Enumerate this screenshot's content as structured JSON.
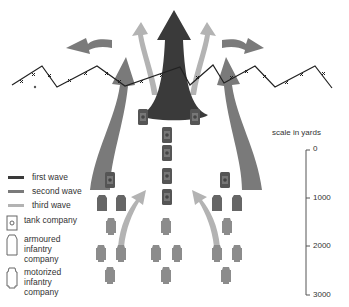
{
  "colors": {
    "first_wave": "#3a3a3a",
    "second_wave": "#7a7a7a",
    "third_wave": "#b3b3b3",
    "unit_dark": "#555555",
    "unit_light": "#8c8c8c",
    "wire": "#222222"
  },
  "legend": {
    "items": [
      {
        "label": "first wave",
        "color": "#3a3a3a"
      },
      {
        "label": "second wave",
        "color": "#7a7a7a"
      },
      {
        "label": "third wave",
        "color": "#b3b3b3"
      }
    ],
    "units": [
      {
        "icon": "tank-company-icon",
        "label": "tank company"
      },
      {
        "icon": "armoured-infantry-company-icon",
        "label_lines": [
          "armoured",
          "infantry",
          "company"
        ]
      },
      {
        "icon": "motorized-infantry-company-icon",
        "label_lines": [
          "motorized",
          "infantry",
          "company"
        ]
      }
    ]
  },
  "scale": {
    "title": "scale in yards",
    "ticks": [
      "0",
      "1000",
      "2000",
      "3000"
    ]
  }
}
